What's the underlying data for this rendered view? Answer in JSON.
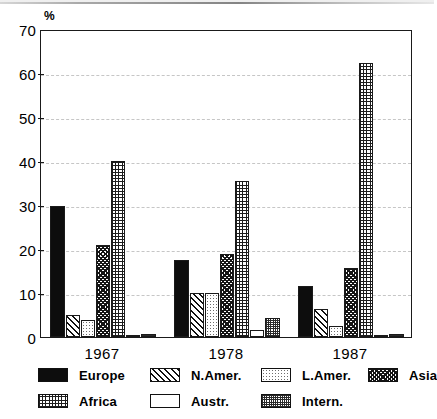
{
  "chart_data": {
    "type": "bar",
    "title": "",
    "xlabel": "",
    "ylabel": "%",
    "ylim": [
      0,
      70
    ],
    "yticks": [
      0,
      10,
      20,
      30,
      40,
      50,
      60,
      70
    ],
    "grid": true,
    "legend_position": "bottom",
    "categories": [
      "1967",
      "1978",
      "1987"
    ],
    "series": [
      {
        "name": "Europe",
        "pattern": "solid-black",
        "values": [
          29.8,
          17.6,
          11.6
        ]
      },
      {
        "name": "N.Amer.",
        "pattern": "diagonal-hatch",
        "values": [
          5.0,
          9.9,
          6.4
        ]
      },
      {
        "name": "L.Amer.",
        "pattern": "light-dots",
        "values": [
          3.9,
          9.9,
          2.4
        ]
      },
      {
        "name": "Asia",
        "pattern": "dense-crosshatch",
        "values": [
          20.9,
          18.8,
          15.6
        ]
      },
      {
        "name": "Africa",
        "pattern": "fine-grid",
        "values": [
          40.0,
          35.5,
          62.2
        ]
      },
      {
        "name": "Austr.",
        "pattern": "white-empty",
        "values": [
          0.0,
          1.6,
          0.3
        ]
      },
      {
        "name": "Intern.",
        "pattern": "dark-speckle",
        "values": [
          0.6,
          4.4,
          0.6
        ]
      }
    ]
  },
  "axis": {
    "unit_label": "%",
    "ytick_labels": [
      "0",
      "10",
      "20",
      "30",
      "40",
      "50",
      "60",
      "70"
    ],
    "xtick_labels": [
      "1967",
      "1978",
      "1987"
    ]
  },
  "legend": {
    "items": [
      {
        "label": "Europe",
        "swatch": "solid-black"
      },
      {
        "label": "N.Amer.",
        "swatch": "diagonal-hatch"
      },
      {
        "label": "L.Amer.",
        "swatch": "light-dots"
      },
      {
        "label": "Asia",
        "swatch": "dense-crosshatch"
      },
      {
        "label": "Africa",
        "swatch": "fine-grid"
      },
      {
        "label": "Austr.",
        "swatch": "white-empty"
      },
      {
        "label": "Intern.",
        "swatch": "dark-speckle"
      }
    ]
  },
  "colors": {
    "ink": "#111111",
    "grid": "#c6c6c6",
    "paper": "#ffffff"
  }
}
